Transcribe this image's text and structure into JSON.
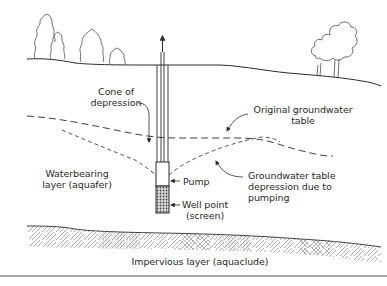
{
  "diagram": {
    "colors": {
      "line": "#2a2a2a",
      "screen": "#555555",
      "hatch": "#666666",
      "background": "#ffffff"
    },
    "labels": {
      "cone_line1": "Cone of",
      "cone_line2": "depression",
      "original_line1": "Original groundwater",
      "original_line2": "table",
      "aquifer_line1": "Waterbearing",
      "aquifer_line2": "layer (aquafer)",
      "pump": "Pump",
      "depression_line1": "Groundwater table",
      "depression_line2": "depression due to",
      "depression_line3": "pumping",
      "wellpoint_line1": "Well point",
      "wellpoint_line2": "(screen)",
      "impervious": "Impervious layer (aquaclude)"
    },
    "elements": [
      "ground-surface",
      "conifer-trees",
      "deciduous-tree",
      "well-casing",
      "flow-arrow-up",
      "original-water-table-dashed",
      "depressed-water-table-dashed",
      "pump",
      "well-screen",
      "impervious-layer-hatched",
      "separator-line"
    ]
  }
}
